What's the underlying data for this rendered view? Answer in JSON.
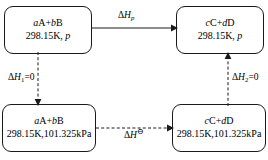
{
  "diagram": {
    "width": 268,
    "height": 160,
    "colors": {
      "stroke": "#1a1a1a",
      "text": "#000000",
      "background": "#ffffff"
    }
  },
  "boxes": {
    "top_left": {
      "name": "reactants-at-pressure-p",
      "species_a_coeff": "a",
      "species_a": "A",
      "plus": "+",
      "species_b_coeff": "b",
      "species_b": "B",
      "species_line": "aA+bB",
      "temperature": "298.15K",
      "separator": ", ",
      "pressure": "p",
      "condition_line": "298.15K, p"
    },
    "top_right": {
      "name": "products-at-pressure-p",
      "species_c_coeff": "c",
      "species_c": "C",
      "plus": "+",
      "species_d_coeff": "d",
      "species_d": "D",
      "species_line": "cC+dD",
      "temperature": "298.15K",
      "separator": ", ",
      "pressure": "p",
      "condition_line": "298.15K, p"
    },
    "bottom_left": {
      "name": "reactants-at-standard-pressure",
      "species_a_coeff": "a",
      "species_a": "A",
      "plus": "+",
      "species_b_coeff": "b",
      "species_b": "B",
      "species_line": "aA+bB",
      "temperature": "298.15K",
      "separator": ",",
      "pressure": "101.325kPa",
      "condition_line": "298.15K,101.325kPa"
    },
    "bottom_right": {
      "name": "products-at-standard-pressure",
      "species_c_coeff": "c",
      "species_c": "C",
      "plus": "+",
      "species_d_coeff": "d",
      "species_d": "D",
      "species_line": "cC+dD",
      "temperature": "298.15K",
      "separator": ",",
      "pressure": "101.325kPa",
      "condition_line": "298.15K,101.325kPa"
    }
  },
  "arrows": {
    "top": {
      "name": "enthalpy-change-at-pressure-p",
      "style": "solid",
      "direction": "right",
      "delta": "Δ",
      "symbol": "H",
      "subscript": "p",
      "superscript": "",
      "label": "ΔH_p"
    },
    "left": {
      "name": "enthalpy-change-step-1",
      "style": "dashed",
      "direction": "down",
      "delta": "Δ",
      "symbol": "H",
      "subscript": "1",
      "suffix": "=0",
      "label": "ΔH₁=0"
    },
    "bottom": {
      "name": "standard-enthalpy-change",
      "style": "dashed",
      "direction": "right",
      "delta": "Δ",
      "symbol": "H",
      "superscript": "⊖",
      "label": "ΔH⊖"
    },
    "right": {
      "name": "enthalpy-change-step-2",
      "style": "dashed",
      "direction": "up",
      "delta": "Δ",
      "symbol": "H",
      "subscript": "2",
      "suffix": "=0",
      "label": "ΔH₂=0"
    }
  }
}
